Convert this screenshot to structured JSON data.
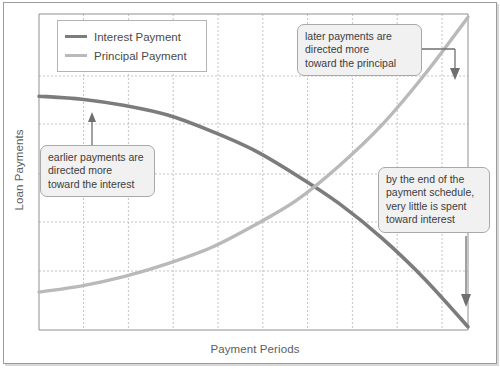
{
  "chart_data": {
    "type": "line",
    "title": "",
    "xlabel": "Payment Periods",
    "ylabel": "Loan Payments",
    "xlim": [
      0,
      10
    ],
    "ylim": [
      0,
      10
    ],
    "grid": true,
    "x_tick_labels": [],
    "y_tick_labels": [],
    "legend_position": "top-left",
    "series": [
      {
        "name": "Interest Payment",
        "color": "#7c7c7c",
        "x": [
          0,
          1,
          2,
          3,
          4,
          5,
          6,
          7,
          8,
          9,
          10
        ],
        "values": [
          7.4,
          7.3,
          7.1,
          6.8,
          6.3,
          5.7,
          4.9,
          4.0,
          2.9,
          1.6,
          0.1
        ]
      },
      {
        "name": "Principal Payment",
        "color": "#b9b9b9",
        "x": [
          0,
          1,
          2,
          3,
          4,
          5,
          6,
          7,
          8,
          9,
          10
        ],
        "values": [
          1.2,
          1.4,
          1.7,
          2.1,
          2.6,
          3.3,
          4.1,
          5.2,
          6.5,
          8.1,
          9.9
        ]
      }
    ],
    "annotations": [
      {
        "id": "earlier-payments",
        "lines": [
          "earlier payments are",
          "directed more",
          "toward the interest"
        ],
        "arrow": "up"
      },
      {
        "id": "later-payments",
        "lines": [
          "later payments are",
          "directed more",
          "toward the principal"
        ],
        "arrow": "elbow-down"
      },
      {
        "id": "end-of-schedule",
        "lines": [
          "by the end of the",
          "payment schedule,",
          "very little is spent",
          "toward interest"
        ],
        "arrow": "down"
      }
    ]
  },
  "legend": {
    "items": [
      {
        "label": "Interest Payment",
        "color": "#7c7c7c"
      },
      {
        "label": "Principal Payment",
        "color": "#b9b9b9"
      }
    ]
  },
  "axes": {
    "x_title": "Payment Periods",
    "y_title": "Loan Payments"
  },
  "annotations": {
    "earlier": {
      "line1": "earlier payments are",
      "line2": "directed more",
      "line3": "toward the interest"
    },
    "later": {
      "line1": "later payments are",
      "line2": "directed more",
      "line3": "toward the principal"
    },
    "end": {
      "line1": "by the end of the",
      "line2": "payment schedule,",
      "line3": "very little is spent",
      "line4": "toward interest"
    }
  },
  "colors": {
    "interest": "#7c7c7c",
    "principal": "#b9b9b9",
    "grid": "#c9c9c9",
    "axis": "#8f8f8f",
    "frame": "#9b9b9b",
    "callout_fill": "#f1f1f1",
    "callout_border": "#a8a8a8"
  }
}
